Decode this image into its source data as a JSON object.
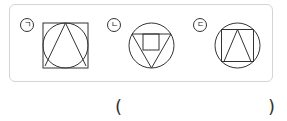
{
  "figures": [
    {
      "label": "ㄱ",
      "description": "square with inscribed circle and triangle"
    },
    {
      "label": "ㄴ",
      "description": "circle with inscribed inverted triangle and square"
    },
    {
      "label": "ㄷ",
      "description": "circle with inscribed square and triangle"
    }
  ],
  "answer": {
    "open": "(",
    "close": ")"
  }
}
